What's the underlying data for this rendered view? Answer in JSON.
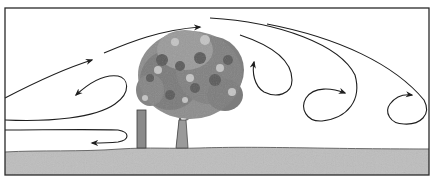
{
  "diagram": {
    "colors": {
      "background": "#ffffff",
      "frame": "#2a2a2a",
      "ground": "#bdbdbd",
      "ground_edge": "#6a6a6a",
      "post": "#8a8a8a",
      "trunk": "#9a9a9a",
      "foliage_dark": "#5a5a5a",
      "foliage_mid": "#8c8c8c",
      "foliage_light": "#c4c4c4",
      "arrow": "#1e1e1e"
    },
    "elements": {
      "frame": "outer-border",
      "ground": "ground-strip",
      "post": "windbreak-post",
      "tree": "deciduous-tree",
      "streamlines": [
        "upwind-lift-arrow",
        "upwind-return-eddy",
        "ground-level-return-flow",
        "over-tree-arrow",
        "leeward-eddy-1",
        "leeward-eddy-2",
        "leeward-eddy-3"
      ]
    }
  }
}
